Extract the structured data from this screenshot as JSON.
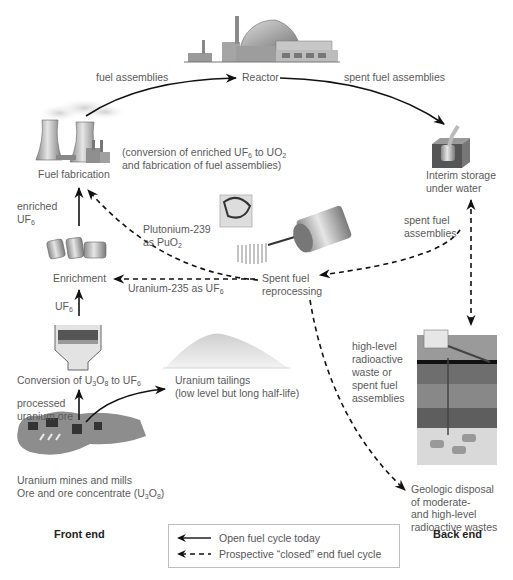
{
  "diagram": {
    "nodes": {
      "reactor": "Reactor",
      "fuel_fabrication": "Fuel fabrication",
      "fabrication_note_1": "(conversion of enriched UF",
      "fabrication_note_1_sub": "6",
      "fabrication_note_1b": " to UO",
      "fabrication_note_1b_sub": "2",
      "fabrication_note_2": "and fabrication of fuel assemblies)",
      "interim_storage_1": "Interim storage",
      "interim_storage_2": "under water",
      "enrichment": "Enrichment",
      "conversion_a": "Conversion of U",
      "conversion_sub1": "3",
      "conversion_b": "O",
      "conversion_sub2": "8",
      "conversion_c": " to UF",
      "conversion_sub3": "6",
      "mines_1": "Uranium mines and mills",
      "mines_2a": "Ore and ore concentrate (U",
      "mines_2_sub1": "3",
      "mines_2b": "O",
      "mines_2_sub2": "8",
      "mines_2c": ")",
      "tailings_1": "Uranium tailings",
      "tailings_2": "(low level but long half-life)",
      "reprocessing_1": "Spent fuel",
      "reprocessing_2": "reprocessing",
      "geologic_1": "Geologic disposal",
      "geologic_2": "of moderate-",
      "geologic_3": "and high-level",
      "geologic_4": "radioactive wastes"
    },
    "edges": {
      "fuel_assemblies": "fuel assemblies",
      "spent_fuel_assemblies": "spent fuel assemblies",
      "enriched_uf6_1": "enriched",
      "enriched_uf6_2": "UF",
      "enriched_uf6_sub": "6",
      "uf6": "UF",
      "uf6_sub": "6",
      "processed_ore_1": "processed",
      "processed_ore_2": "uranium ore",
      "plutonium_1": "Plutonium-239",
      "plutonium_2": "as PuO",
      "plutonium_sub": "2",
      "uranium235": "Uranium-235 as UF",
      "uranium235_sub": "6",
      "spent_fuel_1": "spent fuel",
      "spent_fuel_2": "assemblies",
      "hlw_1": "high-level",
      "hlw_2": "radioactive",
      "hlw_3": "waste or",
      "hlw_4": "spent fuel",
      "hlw_5": "assemblies"
    },
    "sections": {
      "front_end": "Front end",
      "back_end": "Back end"
    },
    "legend": {
      "solid": "Open fuel cycle today",
      "dashed": "Prospective “closed” end fuel cycle"
    }
  }
}
